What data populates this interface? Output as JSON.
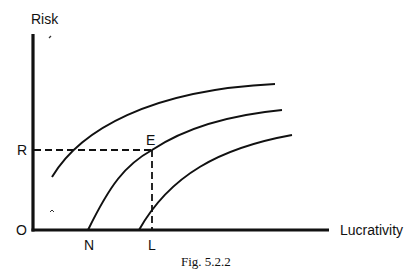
{
  "figure": {
    "caption": "Fig. 5.2.2",
    "y_axis_label": "Risk",
    "x_axis_label": "Lucrativity",
    "origin_label": "O",
    "point_labels": {
      "R": "R",
      "E": "E",
      "N": "N",
      "L": "L"
    },
    "curves": [
      {
        "name": "upper-indifference-curve"
      },
      {
        "name": "middle-indifference-curve",
        "passes_through": "E",
        "x_intercept": "N"
      },
      {
        "name": "lower-indifference-curve"
      }
    ],
    "guides": [
      {
        "name": "risk-level-guide",
        "from": "R",
        "to": "E"
      },
      {
        "name": "lucrativity-level-guide",
        "from": "E",
        "to": "L"
      }
    ]
  }
}
